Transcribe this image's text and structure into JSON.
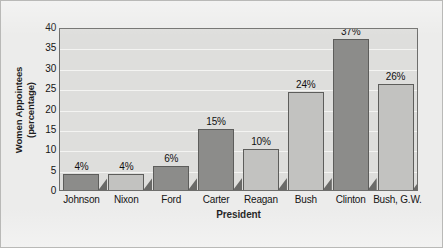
{
  "chart_data": {
    "type": "bar",
    "title": "",
    "xlabel": "President",
    "ylabel": "Women Appointees\n(percentage)",
    "ylabel_line1": "Women Appointees",
    "ylabel_line2": "(percentage)",
    "categories": [
      "Johnson",
      "Nixon",
      "Ford",
      "Carter",
      "Reagan",
      "Bush",
      "Clinton",
      "Bush, G.W."
    ],
    "values": [
      4,
      4,
      6,
      15,
      10,
      24,
      37,
      26
    ],
    "data_labels": [
      "4%",
      "4%",
      "6%",
      "15%",
      "10%",
      "24%",
      "37%",
      "26%"
    ],
    "ylim": [
      0,
      40
    ],
    "yticks": [
      0,
      5,
      10,
      15,
      20,
      25,
      30,
      35,
      40
    ],
    "ytick_labels": [
      "0",
      "5",
      "10",
      "15",
      "20",
      "25",
      "30",
      "35",
      "40"
    ],
    "grid": "horizontal",
    "legend": "none",
    "bar_shades": [
      "dark",
      "light",
      "dark",
      "dark",
      "light",
      "light",
      "dark",
      "light"
    ],
    "colors": {
      "bar_dark": "#8c8c8a",
      "bar_light": "#c2c2c0",
      "bar_outline": "#5d5d5b",
      "bar_shadow": "#6a6a68",
      "plot_background": "#dededc",
      "figure_background": "#ececeb",
      "gridline": "#f4f4f2",
      "axis": "#6e6e6c",
      "text": "#141414"
    }
  }
}
